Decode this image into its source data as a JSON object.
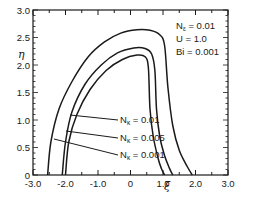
{
  "chart_data": {
    "type": "line",
    "title": "",
    "xlabel": "ξ",
    "ylabel": "η",
    "xlim": [
      -3.0,
      3.0
    ],
    "ylim": [
      0,
      3.0
    ],
    "x_ticks": [
      "-3.0",
      "-2.0",
      "-1.0",
      "0",
      "1.0",
      "2.0",
      "3.0"
    ],
    "y_ticks": [
      "0",
      "0.5",
      "1.0",
      "1.5",
      "2.0",
      "2.5",
      "3.0"
    ],
    "grid": false,
    "annotations": [
      {
        "text": "N_ε = 0.01",
        "main": "N",
        "sub": "ε",
        "rest": " = 0.01"
      },
      {
        "text": "U = 1.0"
      },
      {
        "text": "Bi = 0.001"
      }
    ],
    "series": [
      {
        "name": "N_κ = 0.01",
        "label_main": "N",
        "label_sub": "κ",
        "label_rest": " = 0.01",
        "x": [
          -2.55,
          -2.45,
          -2.2,
          -1.8,
          -1.3,
          -0.8,
          -0.3,
          0.2,
          0.6,
          0.9,
          1.05,
          1.15,
          1.3,
          1.5,
          1.75,
          1.9
        ],
        "y": [
          0.0,
          0.6,
          1.2,
          1.7,
          2.15,
          2.42,
          2.58,
          2.64,
          2.63,
          2.55,
          2.35,
          1.6,
          0.9,
          0.45,
          0.15,
          0.0
        ]
      },
      {
        "name": "N_κ = 0.005",
        "label_main": "N",
        "label_sub": "κ",
        "label_rest": " = 0.005",
        "x": [
          -2.1,
          -2.0,
          -1.8,
          -1.4,
          -0.9,
          -0.4,
          0.1,
          0.45,
          0.65,
          0.75,
          0.8,
          0.9,
          1.05,
          1.2,
          1.3
        ],
        "y": [
          0.0,
          0.6,
          1.15,
          1.65,
          2.0,
          2.22,
          2.31,
          2.3,
          2.2,
          1.9,
          1.2,
          0.7,
          0.35,
          0.12,
          0.0
        ]
      },
      {
        "name": "N_κ = 0.001",
        "label_main": "N",
        "label_sub": "κ",
        "label_rest": " = 0.001",
        "x": [
          -2.0,
          -1.9,
          -1.65,
          -1.25,
          -0.75,
          -0.25,
          0.2,
          0.45,
          0.55,
          0.6,
          0.7,
          0.85,
          0.95,
          1.05
        ],
        "y": [
          0.0,
          0.6,
          1.1,
          1.55,
          1.9,
          2.1,
          2.18,
          2.15,
          1.95,
          1.2,
          0.7,
          0.3,
          0.12,
          0.0
        ]
      }
    ]
  },
  "colors": {
    "line": "#1a1a1a",
    "background": "#ffffff"
  }
}
